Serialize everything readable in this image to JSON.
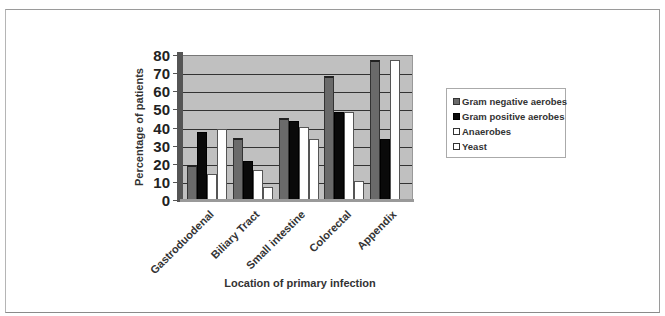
{
  "chart_data": {
    "type": "bar",
    "title": "",
    "xlabel": "Location of primary infection",
    "ylabel": "Percentage of patients",
    "ylim": [
      0,
      80
    ],
    "yticks": [
      0,
      10,
      20,
      30,
      40,
      50,
      60,
      70,
      80
    ],
    "grid": true,
    "legend_position": "right",
    "style": "3d-clustered-column",
    "categories": [
      "Gastroduodenal",
      "Biliary Tract",
      "Small intestine",
      "Colorectal",
      "Appendix"
    ],
    "series": [
      {
        "name": "Gram negative aerobes",
        "color": "#6a6a6a",
        "values": [
          20,
          35,
          46,
          69,
          78
        ]
      },
      {
        "name": "Gram positive aerobes",
        "color": "#0a0a0a",
        "values": [
          38,
          22,
          44,
          49,
          34
        ]
      },
      {
        "name": "Anaerobes",
        "color": "#ffffff",
        "values": [
          15,
          17,
          41,
          49,
          78
        ]
      },
      {
        "name": "Yeast",
        "color": "#ffffff",
        "values": [
          40,
          8,
          34,
          11,
          0
        ]
      }
    ]
  },
  "legend": {
    "items": [
      "Gram negative aerobes",
      "Gram positive aerobes",
      "Anaerobes",
      "Yeast"
    ]
  }
}
